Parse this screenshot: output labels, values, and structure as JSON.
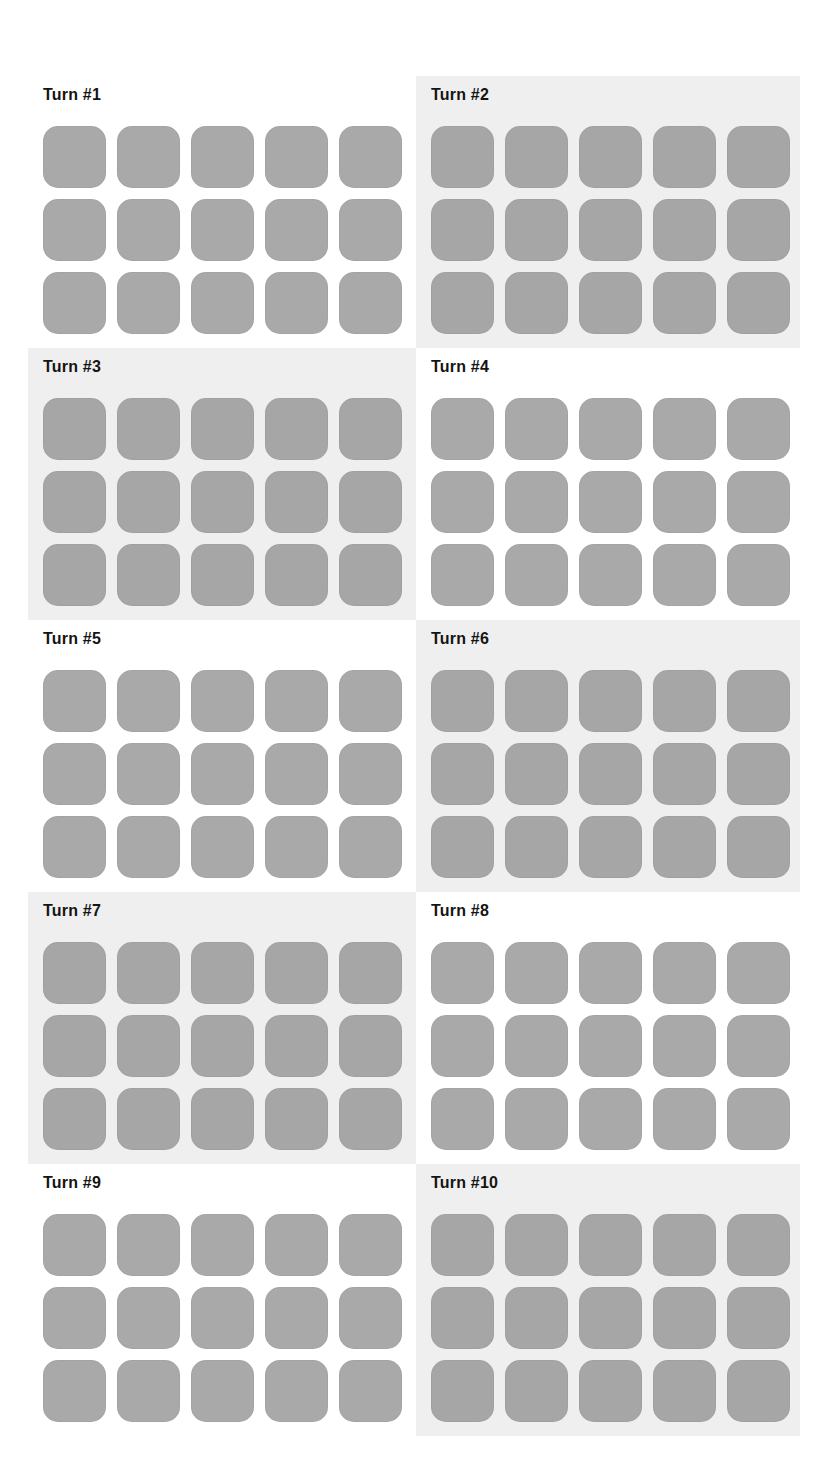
{
  "layout": {
    "columns": 2,
    "rows": 5,
    "tile_rows": 3,
    "tile_cols": 5
  },
  "colors": {
    "background": "#ffffff",
    "panel_shaded": "#efefef",
    "tile": "#a9a9a9",
    "title": "#141414"
  },
  "panels": [
    {
      "title": "Turn #1",
      "shaded": false,
      "tiles": 15
    },
    {
      "title": "Turn #2",
      "shaded": true,
      "tiles": 15
    },
    {
      "title": "Turn #3",
      "shaded": true,
      "tiles": 15
    },
    {
      "title": "Turn #4",
      "shaded": false,
      "tiles": 15
    },
    {
      "title": "Turn #5",
      "shaded": false,
      "tiles": 15
    },
    {
      "title": "Turn #6",
      "shaded": true,
      "tiles": 15
    },
    {
      "title": "Turn #7",
      "shaded": true,
      "tiles": 15
    },
    {
      "title": "Turn #8",
      "shaded": false,
      "tiles": 15
    },
    {
      "title": "Turn #9",
      "shaded": false,
      "tiles": 15
    },
    {
      "title": "Turn #10",
      "shaded": true,
      "tiles": 15
    }
  ]
}
